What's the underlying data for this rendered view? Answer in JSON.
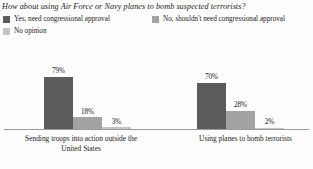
{
  "chart_data": {
    "type": "bar",
    "title": "How about using Air Force or Navy planes to bomb suspected terrorists?",
    "xlabel": "",
    "ylabel": "",
    "ylim": [
      0,
      100
    ],
    "grid": false,
    "legend_position": "top",
    "categories": [
      "Sending troops into action outside the\nUnited States",
      "Using planes to bomb terrorists"
    ],
    "series": [
      {
        "name": "Yes, need congressional approval",
        "color": "#5c5c5c",
        "values": [
          79,
          70
        ],
        "labels": [
          "79%",
          "70%"
        ]
      },
      {
        "name": "No, shouldn't need congressional approval",
        "color": "#a3a3a3",
        "values": [
          18,
          28
        ],
        "labels": [
          "18%",
          "28%"
        ]
      },
      {
        "name": "No opinion",
        "color": "#c4c4c4",
        "values": [
          3,
          2
        ],
        "labels": [
          "3%",
          "2%"
        ]
      }
    ]
  },
  "colors": {
    "background": "#fdfdfd",
    "text": "#1a1a1a",
    "axis": "#9a9a9a"
  }
}
